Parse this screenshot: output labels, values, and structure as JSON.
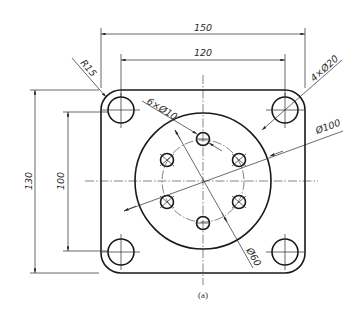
{
  "figure": {
    "caption": "(a)",
    "type": "mechanical-drawing"
  },
  "dimensions": {
    "overall_width": "150",
    "hole_spacing_x": "120",
    "overall_height": "130",
    "hole_spacing_y": "100",
    "corner_radius": "R15",
    "corner_holes": "4×Ø20",
    "bolt_holes": "6×Ø10",
    "boss_diameter": "Ø100",
    "bolt_circle": "Ø60"
  },
  "colors": {
    "line": "#1a1a1a",
    "background": "#ffffff"
  }
}
